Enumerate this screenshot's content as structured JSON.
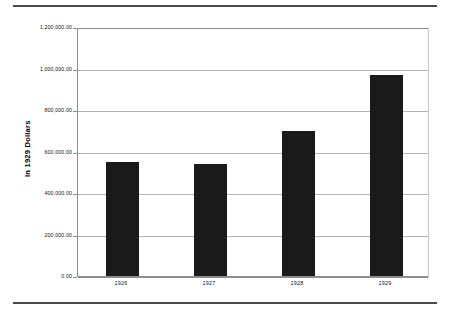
{
  "chart_data": {
    "type": "bar",
    "title": "",
    "subtitle": "",
    "xlabel": "",
    "ylabel": "In 1929 Dollars",
    "categories": [
      "1926",
      "1927",
      "1928",
      "1929"
    ],
    "values": [
      550000,
      540000,
      700000,
      970000
    ],
    "series": [
      {
        "name": "In 1929 Dollars",
        "values": [
          550000,
          540000,
          700000,
          970000
        ]
      }
    ],
    "ylim": [
      0,
      1200000
    ],
    "ytick_values": [
      0,
      200000,
      400000,
      600000,
      800000,
      1000000,
      1200000
    ],
    "ytick_labels": [
      "0.00",
      "200,000.00",
      "400,000.00",
      "600,000.00",
      "800,000.00",
      "1,000,000.00",
      "1,200,000.00"
    ],
    "xtick_labels": [
      "1926",
      "1927",
      "1928",
      "1929"
    ],
    "grid": true,
    "grid_axis": "y",
    "legend": false,
    "legend_position": "none",
    "bar_color": "#1a1a1a",
    "gridline_color": "#b4b4b4",
    "axis_color": "#8d8d8d",
    "plot_background": "#ffffff",
    "annotations": []
  },
  "figure": {
    "rule_color": "#4a4a4a",
    "background": "#ffffff"
  }
}
